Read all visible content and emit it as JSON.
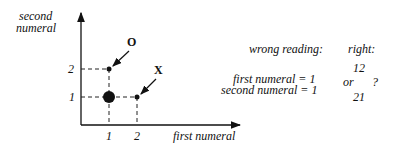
{
  "diagram": {
    "y_axis_label_line1": "second",
    "y_axis_label_line2": "numeral",
    "x_axis_label": "first numeral",
    "x_ticks": [
      "1",
      "2"
    ],
    "y_ticks": [
      "1",
      "2"
    ],
    "points": [
      {
        "label": "",
        "x": 1,
        "y": 1,
        "size": "large"
      },
      {
        "label": "O",
        "x": 1,
        "y": 2,
        "size": "small"
      },
      {
        "label": "X",
        "x": 2,
        "y": 1,
        "size": "small"
      }
    ],
    "point_labels": {
      "o": "O",
      "x": "X"
    }
  },
  "annotation": {
    "wrong_heading": "wrong reading:",
    "wrong_line1": "first numeral = 1",
    "wrong_line2": "second numeral = 1",
    "right_heading": "right:",
    "right_option1": "12",
    "right_or": "or",
    "right_question": "?",
    "right_option2": "21"
  }
}
